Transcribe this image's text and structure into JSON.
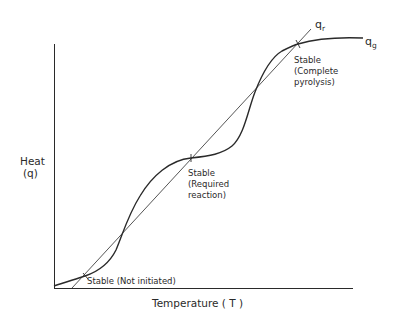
{
  "diagram": {
    "type": "heat-balance diagram",
    "axes": {
      "x_label": "Temperature ( T )",
      "y_label_line1": "Heat",
      "y_label_line2": "(q)"
    },
    "curves": {
      "q_r": {
        "symbol": "q",
        "subscript": "r",
        "description": "heat removal (straight line)"
      },
      "q_g": {
        "symbol": "q",
        "subscript": "g",
        "description": "heat generation (S-shaped curve)"
      }
    },
    "points": [
      {
        "id": "not-initiated",
        "lines": [
          "Stable (Not initiated)"
        ]
      },
      {
        "id": "required-reaction",
        "lines": [
          "Stable",
          "(Required",
          "reaction)"
        ]
      },
      {
        "id": "complete-pyrolysis",
        "lines": [
          "Stable",
          "(Complete",
          "pyrolysis)"
        ]
      }
    ],
    "colors": {
      "line": "#2a2a2a",
      "background": "#ffffff"
    }
  }
}
